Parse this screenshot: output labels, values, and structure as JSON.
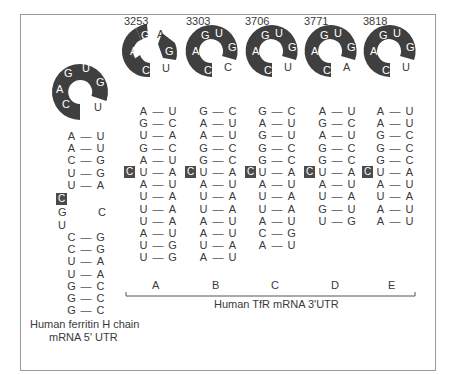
{
  "colors": {
    "loop_fill": "#3f3f3f",
    "loop_text": "#ffffff",
    "text": "#3a3a3a",
    "frame": "#9a9a9a",
    "c_box": "#4a4a4a"
  },
  "ferritin": {
    "loop": {
      "in_ring": [
        "C",
        "A",
        "G",
        "U",
        "G"
      ],
      "outside": "U"
    },
    "upper_stem": [
      [
        "A",
        "U"
      ],
      [
        "A",
        "U"
      ],
      [
        "C",
        "G"
      ],
      [
        "U",
        "G"
      ],
      [
        "U",
        "A"
      ]
    ],
    "bulge_c": "C",
    "interior": {
      "left": [
        "G",
        "U"
      ],
      "right": "C"
    },
    "lower_stem": [
      [
        "C",
        "G"
      ],
      [
        "C",
        "G"
      ],
      [
        "U",
        "A"
      ],
      [
        "U",
        "A"
      ],
      [
        "G",
        "C"
      ],
      [
        "G",
        "C"
      ],
      [
        "G",
        "C"
      ]
    ],
    "label_line1": "Human ferritin H chain",
    "label_line2": "mRNA 5' UTR"
  },
  "tfr": {
    "group_label": "Human TfR mRNA 3'UTR",
    "elements": [
      {
        "id": "A",
        "position": "3253",
        "loop": {
          "in_ring": [
            "C",
            "A",
            "G"
          ],
          "outside": "A",
          "ring2": "G",
          "after": "U"
        },
        "bulge_c": "C",
        "bulge_index": 5,
        "stem": [
          [
            "A",
            "U"
          ],
          [
            "G",
            "C"
          ],
          [
            "U",
            "A"
          ],
          [
            "G",
            "C"
          ],
          [
            "A",
            "U"
          ],
          [
            "U",
            "A"
          ],
          [
            "A",
            "U"
          ],
          [
            "U",
            "A"
          ],
          [
            "U",
            "A"
          ],
          [
            "U",
            "A"
          ],
          [
            "A",
            "U"
          ],
          [
            "U",
            "G"
          ],
          [
            "U",
            "G"
          ]
        ]
      },
      {
        "id": "B",
        "position": "3303",
        "loop": {
          "in_ring": [
            "C",
            "A",
            "G",
            "U",
            "G"
          ],
          "outside": "C"
        },
        "bulge_c": "C",
        "bulge_index": 5,
        "stem": [
          [
            "G",
            "C"
          ],
          [
            "A",
            "U"
          ],
          [
            "A",
            "U"
          ],
          [
            "G",
            "C"
          ],
          [
            "G",
            "C"
          ],
          [
            "U",
            "A"
          ],
          [
            "A",
            "U"
          ],
          [
            "U",
            "A"
          ],
          [
            "U",
            "A"
          ],
          [
            "A",
            "U"
          ],
          [
            "A",
            "U"
          ],
          [
            "U",
            "A"
          ],
          [
            "A",
            "U"
          ]
        ]
      },
      {
        "id": "C",
        "position": "3706",
        "loop": {
          "in_ring": [
            "C",
            "A",
            "G",
            "U",
            "G"
          ],
          "outside": "U"
        },
        "bulge_c": "C",
        "bulge_index": 5,
        "stem": [
          [
            "G",
            "C"
          ],
          [
            "A",
            "U"
          ],
          [
            "G",
            "U"
          ],
          [
            "G",
            "C"
          ],
          [
            "G",
            "C"
          ],
          [
            "U",
            "A"
          ],
          [
            "A",
            "U"
          ],
          [
            "U",
            "A"
          ],
          [
            "U",
            "A"
          ],
          [
            "A",
            "U"
          ],
          [
            "C",
            "G"
          ],
          [
            "A",
            "U"
          ]
        ]
      },
      {
        "id": "D",
        "position": "3771",
        "loop": {
          "in_ring": [
            "C",
            "A",
            "G",
            "U",
            "G"
          ],
          "outside": "A"
        },
        "bulge_c": "C",
        "bulge_index": 5,
        "stem": [
          [
            "A",
            "U"
          ],
          [
            "G",
            "C"
          ],
          [
            "A",
            "U"
          ],
          [
            "G",
            "C"
          ],
          [
            "G",
            "C"
          ],
          [
            "U",
            "A"
          ],
          [
            "A",
            "U"
          ],
          [
            "U",
            "A"
          ],
          [
            "G",
            "U"
          ],
          [
            "U",
            "G"
          ]
        ]
      },
      {
        "id": "E",
        "position": "3818",
        "loop": {
          "in_ring": [
            "C",
            "A",
            "G",
            "U",
            "G"
          ],
          "outside": "U"
        },
        "bulge_c": "C",
        "bulge_index": 5,
        "stem": [
          [
            "A",
            "U"
          ],
          [
            "A",
            "U"
          ],
          [
            "G",
            "C"
          ],
          [
            "G",
            "C"
          ],
          [
            "G",
            "C"
          ],
          [
            "U",
            "A"
          ],
          [
            "A",
            "U"
          ],
          [
            "U",
            "A"
          ],
          [
            "A",
            "U"
          ],
          [
            "A",
            "U"
          ]
        ]
      }
    ]
  },
  "dash": "—"
}
